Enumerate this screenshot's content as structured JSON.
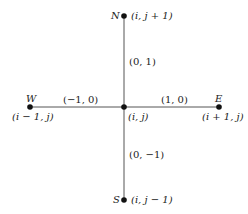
{
  "diagram": {
    "center": {
      "label": "(i, j)"
    },
    "nodes": [
      {
        "id": "N",
        "letter": "N",
        "coord": "(i, j + 1)",
        "edge_label": "(0, 1)"
      },
      {
        "id": "S",
        "letter": "S",
        "coord": "(i, j − 1)",
        "edge_label": "(0, −1)"
      },
      {
        "id": "W",
        "letter": "W",
        "coord": "(i − 1, j)",
        "edge_label": "(−1, 0)"
      },
      {
        "id": "E",
        "letter": "E",
        "coord": "(i + 1, j)",
        "edge_label": "(1, 0)"
      }
    ],
    "colors": {
      "line": "#555555",
      "node": "#111111",
      "text": "#222222"
    }
  }
}
